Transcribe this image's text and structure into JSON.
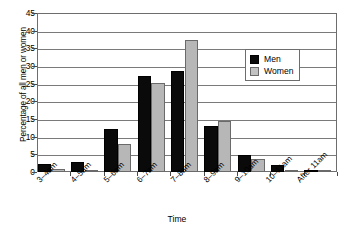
{
  "chart_data": {
    "type": "bar",
    "title": "",
    "subtitle": "",
    "xlabel": "Time",
    "ylabel": "Percentage of all men or women",
    "ylim": [
      0,
      45
    ],
    "ytick_step": 5,
    "yticks": [
      0,
      5,
      10,
      15,
      20,
      25,
      30,
      35,
      40,
      45
    ],
    "grid": true,
    "legend_position": "top-right",
    "categories": [
      "3–4am",
      "4–5am",
      "5–6am",
      "6–7am",
      "7–8am",
      "8–9am",
      "9–10am",
      "10–11am",
      "After 11am"
    ],
    "series": [
      {
        "name": "Men",
        "color": "#0a0a0a",
        "values": [
          2.2,
          2.8,
          12.3,
          27.2,
          28.5,
          13.1,
          4.7,
          2.0,
          0.4
        ]
      },
      {
        "name": "Women",
        "color": "#b7b7b7",
        "values": [
          0.9,
          0.5,
          8.0,
          25.3,
          37.3,
          14.5,
          3.8,
          0.3,
          0.2
        ]
      }
    ]
  },
  "legend": {
    "items": [
      {
        "label": "Men"
      },
      {
        "label": "Women"
      }
    ]
  }
}
